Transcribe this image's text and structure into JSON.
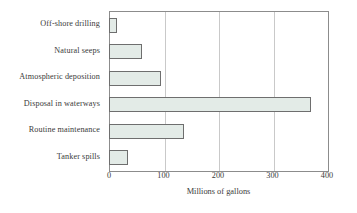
{
  "chart_data": {
    "type": "bar",
    "orientation": "horizontal",
    "title": "",
    "xlabel": "Millions of gallons",
    "ylabel": "",
    "xlim": [
      0,
      400
    ],
    "xticks": [
      0,
      100,
      200,
      300,
      400
    ],
    "xtick_labels": [
      "0",
      "100",
      "200",
      "300",
      "400"
    ],
    "grid": true,
    "grid_axis": "x",
    "legend": false,
    "categories": [
      "Off-shore drilling",
      "Natural seeps",
      "Atmospheric deposition",
      "Disposal in waterways",
      "Routine maintenance",
      "Tanker spills"
    ],
    "values": [
      15,
      60,
      95,
      370,
      137,
      35
    ],
    "bar_fill_color": "#e3ebe7",
    "bar_edge_color": "#6e6e6e",
    "gridline_color": "#c9c9c9",
    "axis_color": "#8c8c8c"
  }
}
